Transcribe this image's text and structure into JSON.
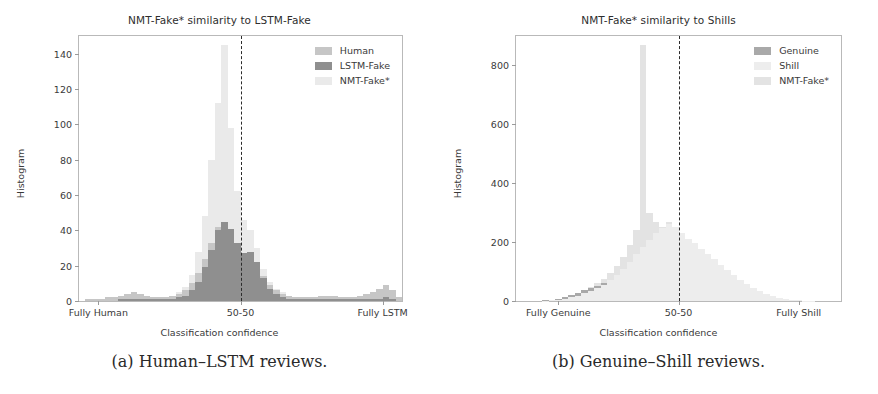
{
  "figure": {
    "panels": [
      {
        "id": "panel-a",
        "caption": "(a) Human–LSTM reviews.",
        "chart_data": {
          "type": "bar",
          "title": "NMT-Fake* similarity to LSTM-Fake",
          "xlabel": "Classification confidence",
          "ylabel": "Histogram",
          "xlim": [
            0,
            1
          ],
          "ylim": [
            0,
            150
          ],
          "yticks": [
            0,
            20,
            40,
            60,
            80,
            100,
            120,
            140
          ],
          "xtick_positions": [
            0.06,
            0.5,
            0.94
          ],
          "xticklabels": [
            "Fully Human",
            "50-50",
            "Fully LSTM"
          ],
          "grid": false,
          "legend_position": "upper right",
          "annotations": [
            {
              "type": "vline",
              "x": 0.5,
              "style": "dashed",
              "color": "#2b2b2b"
            }
          ],
          "bin_width": 0.02,
          "x": [
            0.01,
            0.03,
            0.05,
            0.07,
            0.09,
            0.11,
            0.13,
            0.15,
            0.17,
            0.19,
            0.21,
            0.23,
            0.25,
            0.27,
            0.29,
            0.31,
            0.33,
            0.35,
            0.37,
            0.39,
            0.41,
            0.43,
            0.45,
            0.47,
            0.49,
            0.51,
            0.53,
            0.55,
            0.57,
            0.59,
            0.61,
            0.63,
            0.65,
            0.67,
            0.69,
            0.71,
            0.73,
            0.75,
            0.77,
            0.79,
            0.81,
            0.83,
            0.85,
            0.87,
            0.89,
            0.91,
            0.93,
            0.95,
            0.97,
            0.99
          ],
          "series": [
            {
              "name": "Human",
              "color": "#c6c6c6",
              "values": [
                0,
                1,
                1,
                1,
                2,
                2,
                3,
                4,
                5,
                4,
                3,
                2,
                2,
                2,
                3,
                4,
                6,
                10,
                16,
                24,
                33,
                42,
                44,
                38,
                29,
                24,
                26,
                21,
                14,
                9,
                6,
                4,
                3,
                2,
                2,
                2,
                2,
                3,
                3,
                3,
                2,
                2,
                2,
                3,
                4,
                5,
                7,
                9,
                6,
                2
              ]
            },
            {
              "name": "LSTM-Fake",
              "color": "#8f8f8f",
              "values": [
                0,
                0,
                0,
                0,
                0,
                0,
                1,
                1,
                1,
                1,
                1,
                1,
                1,
                1,
                1,
                2,
                3,
                6,
                11,
                19,
                29,
                40,
                45,
                41,
                33,
                27,
                28,
                22,
                13,
                7,
                4,
                2,
                1,
                1,
                1,
                1,
                1,
                1,
                1,
                1,
                1,
                1,
                1,
                1,
                1,
                1,
                1,
                2,
                1,
                0
              ]
            },
            {
              "name": "NMT-Fake*",
              "color": "#eaeaea",
              "values": [
                0,
                1,
                1,
                1,
                2,
                2,
                3,
                4,
                5,
                4,
                3,
                2,
                2,
                2,
                3,
                5,
                8,
                15,
                28,
                48,
                80,
                112,
                145,
                98,
                62,
                46,
                40,
                30,
                18,
                11,
                7,
                5,
                3,
                2,
                2,
                2,
                2,
                3,
                3,
                3,
                2,
                2,
                2,
                3,
                4,
                5,
                7,
                9,
                6,
                2
              ]
            }
          ]
        }
      },
      {
        "id": "panel-b",
        "caption": "(b) Genuine–Shill reviews.",
        "chart_data": {
          "type": "bar",
          "title": "NMT-Fake* similarity to Shills",
          "xlabel": "Classification confidence",
          "ylabel": "Histogram",
          "xlim": [
            0,
            1
          ],
          "ylim": [
            0,
            900
          ],
          "yticks": [
            0,
            200,
            400,
            600,
            800
          ],
          "xtick_positions": [
            0.13,
            0.5,
            0.87
          ],
          "xticklabels": [
            "Fully Genuine",
            "50-50",
            "Fully Shill"
          ],
          "grid": false,
          "legend_position": "upper right",
          "annotations": [
            {
              "type": "vline",
              "x": 0.5,
              "style": "dashed",
              "color": "#2b2b2b"
            }
          ],
          "bin_width": 0.02,
          "x": [
            0.01,
            0.03,
            0.05,
            0.07,
            0.09,
            0.11,
            0.13,
            0.15,
            0.17,
            0.19,
            0.21,
            0.23,
            0.25,
            0.27,
            0.29,
            0.31,
            0.33,
            0.35,
            0.37,
            0.39,
            0.41,
            0.43,
            0.45,
            0.47,
            0.49,
            0.51,
            0.53,
            0.55,
            0.57,
            0.59,
            0.61,
            0.63,
            0.65,
            0.67,
            0.69,
            0.71,
            0.73,
            0.75,
            0.77,
            0.79,
            0.81,
            0.83,
            0.85,
            0.87,
            0.89,
            0.91,
            0.93,
            0.95,
            0.97,
            0.99
          ],
          "series": [
            {
              "name": "Genuine",
              "color": "#a9a9a9",
              "values": [
                0,
                0,
                0,
                0,
                2,
                4,
                8,
                14,
                20,
                28,
                36,
                44,
                52,
                60,
                70,
                84,
                96,
                104,
                112,
                118,
                122,
                126,
                128,
                130,
                126,
                120,
                116,
                110,
                102,
                94,
                84,
                74,
                64,
                54,
                44,
                36,
                28,
                22,
                16,
                12,
                8,
                6,
                4,
                2,
                1,
                1,
                0,
                0,
                0,
                0
              ]
            },
            {
              "name": "Shill",
              "color": "#ededed",
              "values": [
                0,
                0,
                0,
                0,
                1,
                2,
                4,
                8,
                12,
                18,
                26,
                34,
                44,
                56,
                70,
                90,
                110,
                134,
                160,
                184,
                208,
                232,
                248,
                262,
                250,
                232,
                212,
                196,
                178,
                160,
                142,
                124,
                106,
                88,
                72,
                58,
                44,
                34,
                24,
                16,
                10,
                6,
                4,
                2,
                1,
                1,
                0,
                0,
                0,
                0
              ]
            },
            {
              "name": "NMT-Fake*",
              "color": "#e3e3e3",
              "values": [
                0,
                0,
                0,
                0,
                1,
                3,
                6,
                10,
                16,
                24,
                34,
                46,
                60,
                76,
                96,
                120,
                150,
                190,
                240,
                870,
                300,
                270,
                250,
                270,
                240,
                210,
                186,
                168,
                150,
                132,
                116,
                100,
                84,
                70,
                56,
                44,
                34,
                26,
                18,
                12,
                8,
                5,
                3,
                2,
                1,
                1,
                0,
                0,
                0,
                0
              ]
            }
          ]
        }
      }
    ]
  }
}
